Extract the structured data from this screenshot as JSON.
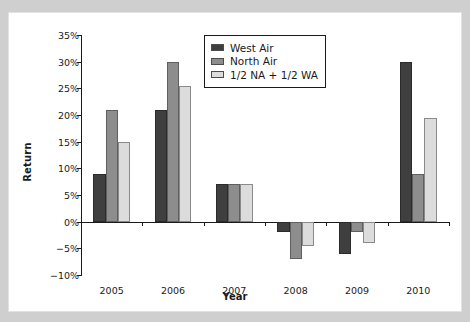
{
  "chart_data": {
    "type": "bar",
    "title": "",
    "xlabel": "Year",
    "ylabel": "Return",
    "categories": [
      "2005",
      "2006",
      "2007",
      "2008",
      "2009",
      "2010"
    ],
    "series": [
      {
        "name": "West Air",
        "color": "#3f3f3f",
        "values": [
          9,
          21,
          7,
          -2,
          -6,
          30
        ]
      },
      {
        "name": "North Air",
        "color": "#8d8d8d",
        "values": [
          21,
          30,
          7,
          -7,
          -2,
          9
        ]
      },
      {
        "name": "1/2 NA + 1/2 WA",
        "color": "#dcdcdc",
        "values": [
          15,
          25.5,
          7,
          -4.5,
          -4,
          19.5
        ]
      }
    ],
    "ylim": [
      -10,
      35
    ],
    "ytick_values": [
      35,
      30,
      25,
      20,
      15,
      10,
      5,
      0,
      -5,
      -10
    ],
    "ytick_labels": [
      "35%",
      "30%",
      "25%",
      "20%",
      "15%",
      "10%",
      "5%",
      "0%",
      "−10%"
    ],
    "ytick_labels_full": [
      "35%",
      "30%",
      "25%",
      "20%",
      "15%",
      "10%",
      "5%",
      "0%",
      "−5%",
      "−10%"
    ],
    "grid": false,
    "legend_position": "upper center",
    "value_unit": "%"
  },
  "page": {
    "background_color": "#cfcfcf",
    "figure_background": "#ffffff",
    "axis_color": "#1a1a1a",
    "top_caption": ""
  }
}
